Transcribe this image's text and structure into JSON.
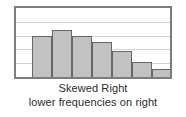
{
  "figure": {
    "background_color": "#ffffff",
    "frame_color": "#7d7d7d",
    "gridline_color": "#d2d2d2",
    "bar_fill_color": "#c2c2c2",
    "bar_border_color": "#666666",
    "caption_color": "#2b2b2b"
  },
  "captions": {
    "title": "Skewed Right",
    "subtitle": "lower frequencies on right"
  },
  "chart_data": {
    "type": "bar",
    "title": "Skewed Right",
    "subtitle": "lower frequencies on right",
    "xlabel": "",
    "ylabel": "",
    "categories": [
      "1",
      "2",
      "3",
      "4",
      "5",
      "6",
      "7"
    ],
    "values": [
      3.0,
      3.4,
      3.0,
      2.5,
      1.9,
      1.1,
      0.6
    ],
    "ylim": [
      0,
      5
    ],
    "yticks": [
      0,
      1,
      2,
      3,
      4,
      5
    ],
    "tick_labels_shown": false,
    "grid": true,
    "gridline_count": 4,
    "legend": "none",
    "annotations": [
      "Skewed Right",
      "lower frequencies on right"
    ]
  }
}
